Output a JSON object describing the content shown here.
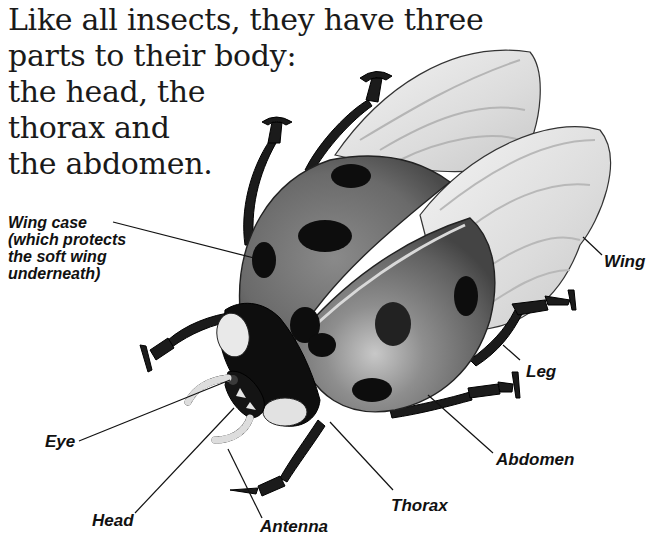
{
  "intro": {
    "lines": [
      "Like all insects, they have three",
      "parts to their body:",
      "the head, the",
      "thorax and",
      "the abdomen."
    ]
  },
  "labels": {
    "wing_case": [
      "Wing case",
      "(which protects",
      "the soft wing",
      "underneath)"
    ],
    "wing": "Wing",
    "leg": "Leg",
    "eye": "Eye",
    "abdomen": "Abdomen",
    "thorax": "Thorax",
    "head": "Head",
    "antenna": "Antenna"
  },
  "colors": {
    "background": "#ffffff",
    "elytra": "#6e6e6e",
    "spots": "#0d0d0d",
    "wing": "#e4e4e4",
    "text": "#111111"
  }
}
